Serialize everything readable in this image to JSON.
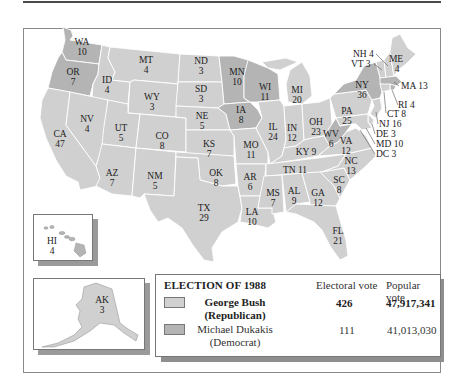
{
  "title": "ELECTION OF 1988",
  "colors": {
    "republican": "#d0d0d0",
    "democrat": "#b4b4b4",
    "state_border": "#ffffff",
    "frame": "#8a8a8a",
    "shadow": "#8e8e8e"
  },
  "legend": {
    "title": "ELECTION OF 1988",
    "col_electoral": "Electoral vote",
    "col_popular": "Popular vote",
    "candidates": [
      {
        "name": "George Bush",
        "party": "(Republican)",
        "electoral": "426",
        "popular": "47,917,341",
        "color": "#d0d0d0",
        "bold": true
      },
      {
        "name": "Michael Dukakis",
        "party": "(Democrat)",
        "electoral": "111",
        "popular": "41,013,030",
        "color": "#b4b4b4",
        "bold": false
      }
    ]
  },
  "states": [
    {
      "abbr": "WA",
      "ev": "10",
      "winner": "D"
    },
    {
      "abbr": "OR",
      "ev": "7",
      "winner": "D"
    },
    {
      "abbr": "CA",
      "ev": "47",
      "winner": "R"
    },
    {
      "abbr": "ID",
      "ev": "4",
      "winner": "R"
    },
    {
      "abbr": "NV",
      "ev": "4",
      "winner": "R"
    },
    {
      "abbr": "MT",
      "ev": "4",
      "winner": "R"
    },
    {
      "abbr": "WY",
      "ev": "3",
      "winner": "R"
    },
    {
      "abbr": "UT",
      "ev": "5",
      "winner": "R"
    },
    {
      "abbr": "AZ",
      "ev": "7",
      "winner": "R"
    },
    {
      "abbr": "CO",
      "ev": "8",
      "winner": "R"
    },
    {
      "abbr": "NM",
      "ev": "5",
      "winner": "R"
    },
    {
      "abbr": "ND",
      "ev": "3",
      "winner": "R"
    },
    {
      "abbr": "SD",
      "ev": "3",
      "winner": "R"
    },
    {
      "abbr": "NE",
      "ev": "5",
      "winner": "R"
    },
    {
      "abbr": "KS",
      "ev": "7",
      "winner": "R"
    },
    {
      "abbr": "OK",
      "ev": "8",
      "winner": "R"
    },
    {
      "abbr": "TX",
      "ev": "29",
      "winner": "R"
    },
    {
      "abbr": "MN",
      "ev": "10",
      "winner": "D"
    },
    {
      "abbr": "IA",
      "ev": "8",
      "winner": "D"
    },
    {
      "abbr": "MO",
      "ev": "11",
      "winner": "R"
    },
    {
      "abbr": "AR",
      "ev": "6",
      "winner": "R"
    },
    {
      "abbr": "LA",
      "ev": "10",
      "winner": "R"
    },
    {
      "abbr": "WI",
      "ev": "11",
      "winner": "D"
    },
    {
      "abbr": "IL",
      "ev": "24",
      "winner": "R"
    },
    {
      "abbr": "MI",
      "ev": "20",
      "winner": "R"
    },
    {
      "abbr": "IN",
      "ev": "12",
      "winner": "R"
    },
    {
      "abbr": "OH",
      "ev": "23",
      "winner": "R"
    },
    {
      "abbr": "KY",
      "ev": "9",
      "winner": "R"
    },
    {
      "abbr": "TN",
      "ev": "11",
      "winner": "R"
    },
    {
      "abbr": "MS",
      "ev": "7",
      "winner": "R"
    },
    {
      "abbr": "AL",
      "ev": "9",
      "winner": "R"
    },
    {
      "abbr": "GA",
      "ev": "12",
      "winner": "R"
    },
    {
      "abbr": "FL",
      "ev": "21",
      "winner": "R"
    },
    {
      "abbr": "SC",
      "ev": "8",
      "winner": "R"
    },
    {
      "abbr": "NC",
      "ev": "13",
      "winner": "R"
    },
    {
      "abbr": "VA",
      "ev": "12",
      "winner": "R"
    },
    {
      "abbr": "WV",
      "ev": "6",
      "winner": "D"
    },
    {
      "abbr": "PA",
      "ev": "25",
      "winner": "R"
    },
    {
      "abbr": "NY",
      "ev": "36",
      "winner": "D"
    },
    {
      "abbr": "VT",
      "ev": "3",
      "winner": "R"
    },
    {
      "abbr": "NH",
      "ev": "4",
      "winner": "R"
    },
    {
      "abbr": "ME",
      "ev": "4",
      "winner": "R"
    },
    {
      "abbr": "MA",
      "ev": "13",
      "winner": "D"
    },
    {
      "abbr": "RI",
      "ev": "4",
      "winner": "D"
    },
    {
      "abbr": "CT",
      "ev": "8",
      "winner": "R"
    },
    {
      "abbr": "NJ",
      "ev": "16",
      "winner": "R"
    },
    {
      "abbr": "DE",
      "ev": "3",
      "winner": "R"
    },
    {
      "abbr": "MD",
      "ev": "10",
      "winner": "R"
    },
    {
      "abbr": "DC",
      "ev": "3",
      "winner": "D"
    },
    {
      "abbr": "HI",
      "ev": "4",
      "winner": "D"
    },
    {
      "abbr": "AK",
      "ev": "3",
      "winner": "R"
    }
  ],
  "labels": {
    "WA": "WA",
    "WA_ev": "10",
    "OR": "OR",
    "OR_ev": "7",
    "CA": "CA",
    "CA_ev": "47",
    "ID": "ID",
    "ID_ev": "4",
    "NV": "NV",
    "NV_ev": "4",
    "MT": "MT",
    "MT_ev": "4",
    "WY": "WY",
    "WY_ev": "3",
    "UT": "UT",
    "UT_ev": "5",
    "AZ": "AZ",
    "AZ_ev": "7",
    "CO": "CO",
    "CO_ev": "8",
    "NM": "NM",
    "NM_ev": "5",
    "ND": "ND",
    "ND_ev": "3",
    "SD": "SD",
    "SD_ev": "3",
    "NE": "NE",
    "NE_ev": "5",
    "KS": "KS",
    "KS_ev": "7",
    "OK": "OK",
    "OK_ev": "8",
    "TX": "TX",
    "TX_ev": "29",
    "MN": "MN",
    "MN_ev": "10",
    "IA": "IA",
    "IA_ev": "8",
    "MO": "MO",
    "MO_ev": "11",
    "AR": "AR",
    "AR_ev": "6",
    "LA": "LA",
    "LA_ev": "10",
    "WI": "WI",
    "WI_ev": "11",
    "IL": "IL",
    "IL_ev": "24",
    "MI": "MI",
    "MI_ev": "20",
    "IN": "IN",
    "IN_ev": "12",
    "OH": "OH",
    "OH_ev": "23",
    "KY": "KY 9",
    "TN": "TN 11",
    "MS": "MS",
    "MS_ev": "7",
    "AL": "AL",
    "AL_ev": "9",
    "GA": "GA",
    "GA_ev": "12",
    "FL": "FL",
    "FL_ev": "21",
    "SC": "SC",
    "SC_ev": "8",
    "NC": "NC",
    "NC_ev": "13",
    "VA": "VA",
    "VA_ev": "12",
    "WV": "WV",
    "WV_ev": "6",
    "PA": "PA",
    "PA_ev": "25",
    "NY": "NY",
    "NY_ev": "36",
    "ME": "ME",
    "ME_ev": "4",
    "NH": "NH 4",
    "VT": "VT 3",
    "MA": "MA 13",
    "RI": "RI 4",
    "CT": "CT 8",
    "NJ": "NJ 16",
    "DE": "DE 3",
    "MD": "MD 10",
    "DC": "DC 3",
    "HI": "HI",
    "HI_ev": "4",
    "AK": "AK",
    "AK_ev": "3"
  }
}
